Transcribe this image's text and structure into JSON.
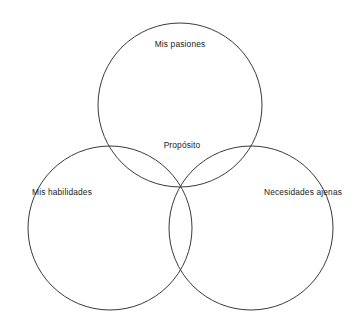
{
  "diagram": {
    "type": "venn-3-circle",
    "title": "",
    "background_color": "#ffffff",
    "stroke_color": "#3a3a3a",
    "stroke_width": 1,
    "text_color": "#1a1a1a",
    "intersection_fill": "#f0f0f0",
    "sets": [
      {
        "id": "pasiones",
        "label": "Mis pasiones",
        "position": "top",
        "center_x": 180,
        "center_y": 105,
        "radius": 82,
        "label_x": 180,
        "label_y": 45
      },
      {
        "id": "habilidades",
        "label": "Mis habilidades",
        "position": "bottom-left",
        "center_x": 110,
        "center_y": 228,
        "radius": 82,
        "label_x": 62,
        "label_y": 193
      },
      {
        "id": "necesidades",
        "label": "Necesidades ajenas",
        "position": "bottom-right",
        "center_x": 251,
        "center_y": 228,
        "radius": 82,
        "label_x": 303,
        "label_y": 193
      }
    ],
    "center_region": {
      "id": "proposito",
      "label": "Propósito",
      "label_x": 182,
      "label_y": 146,
      "fill": "#f0f0f0"
    }
  }
}
